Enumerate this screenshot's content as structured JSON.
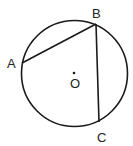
{
  "diagram": {
    "colors": {
      "stroke": "#1a1a1a",
      "label": "#222222",
      "background": "#ffffff"
    },
    "circle": {
      "center": "O",
      "cx": 74.5,
      "cy": 73.5,
      "r": 53
    },
    "points": [
      {
        "name": "A",
        "x": 22,
        "y": 63,
        "label": "A",
        "lx": 7,
        "ly": 68
      },
      {
        "name": "B",
        "x": 96,
        "y": 24,
        "label": "B",
        "lx": 92,
        "ly": 18
      },
      {
        "name": "C",
        "x": 99,
        "y": 122,
        "label": "C",
        "lx": 97,
        "ly": 142
      },
      {
        "name": "O",
        "x": 74,
        "y": 73,
        "label": "O",
        "lx": 70,
        "ly": 88
      }
    ],
    "segments": [
      {
        "from": "A",
        "to": "B"
      },
      {
        "from": "B",
        "to": "C"
      }
    ],
    "labels": {
      "A": "A",
      "B": "B",
      "C": "C",
      "O": "O"
    }
  }
}
